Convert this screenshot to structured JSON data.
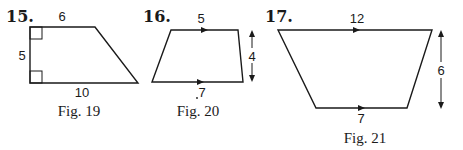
{
  "figures": [
    {
      "problem_number": "15.",
      "caption": "Fig. 19",
      "shape": "right trapezoid",
      "labels": {
        "top": "6",
        "left": "5",
        "bottom": "10"
      },
      "markers": [
        "right-angle top-left",
        "right-angle bottom-left"
      ]
    },
    {
      "problem_number": "16.",
      "caption": "Fig. 20",
      "shape": "trapezoid",
      "labels": {
        "top": "5",
        "height": "4",
        "bottom": "7"
      },
      "markers": [
        "parallel arrow top",
        "parallel arrow bottom",
        "height double arrow right"
      ]
    },
    {
      "problem_number": "17.",
      "caption": "Fig. 21",
      "shape": "trapezoid",
      "labels": {
        "top": "12",
        "height": "6",
        "bottom": "7"
      },
      "markers": [
        "parallel arrow top",
        "parallel arrow bottom",
        "height double arrow right"
      ]
    }
  ]
}
